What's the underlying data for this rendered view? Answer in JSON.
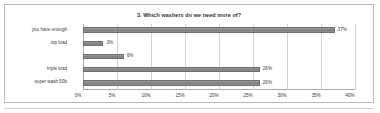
{
  "chart_data": {
    "type": "bar",
    "orientation": "horizontal",
    "title": "3. Which washers do we need more of?",
    "xlabel": "",
    "ylabel": "",
    "categories": [
      "you have enough",
      "top load",
      "",
      "triple load",
      "super wash 50b"
    ],
    "values": [
      37,
      3,
      6,
      26,
      26
    ],
    "data_labels": [
      "37%",
      "3%",
      "6%",
      "26%",
      "26%"
    ],
    "xlim": [
      0,
      40
    ],
    "xticks": [
      0,
      5,
      10,
      15,
      20,
      25,
      30,
      35,
      40
    ],
    "xtick_labels": [
      "0%",
      "5%",
      "10%",
      "15%",
      "20%",
      "25%",
      "30%",
      "35%",
      "40%"
    ],
    "grid": true,
    "gridlines": "vertical",
    "legend": false,
    "series": [
      {
        "name": "",
        "values": [
          37,
          3,
          6,
          26,
          26
        ],
        "color": "#8a8a8a"
      }
    ],
    "colors": {
      "bar_fill": "#8a8a8a",
      "bar_edge": "#6f6f6f",
      "gridline": "#d2d2d2",
      "axis": "#a8a8a8",
      "text": "#3a3a3a",
      "frame": "#b9b9b9",
      "background": "#ffffff"
    }
  }
}
